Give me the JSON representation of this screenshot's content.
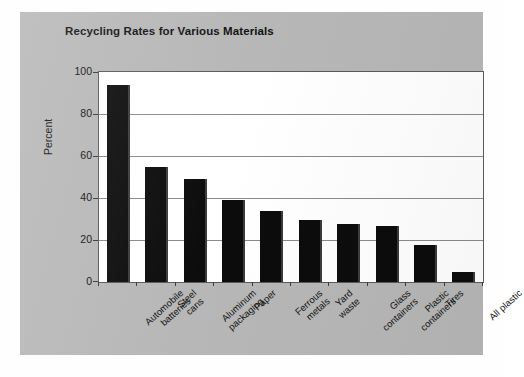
{
  "chart_data": {
    "type": "bar",
    "title": "Recycling Rates for Various Materials",
    "xlabel": "",
    "ylabel": "Percent",
    "ylim": [
      0,
      100
    ],
    "yticks": [
      0,
      20,
      40,
      60,
      80,
      100
    ],
    "grid": true,
    "legend": "none",
    "bar_color": "#0c0c0c",
    "plot_background": "#ffffff",
    "panel_background": "#b7b7b7",
    "categories": [
      "Automobile batteries",
      "Steel cans",
      "Aluminum packaging",
      "Paper",
      "Ferrous metals",
      "Yard waste",
      "Glass containers",
      "Plastic containers",
      "Tires",
      "All plastic"
    ],
    "category_lines": [
      [
        "Automobile",
        "batteries"
      ],
      [
        "Steel",
        "cans"
      ],
      [
        "Aluminum",
        "packaging"
      ],
      [
        "Paper"
      ],
      [
        "Ferrous",
        "metals"
      ],
      [
        "Yard",
        "waste"
      ],
      [
        "Glass",
        "containers"
      ],
      [
        "Plastic",
        "containers"
      ],
      [
        "Tires"
      ],
      [
        "All plastic"
      ]
    ],
    "values": [
      94,
      55,
      49,
      39,
      34,
      29.5,
      27.5,
      26.5,
      17.5,
      5
    ]
  }
}
